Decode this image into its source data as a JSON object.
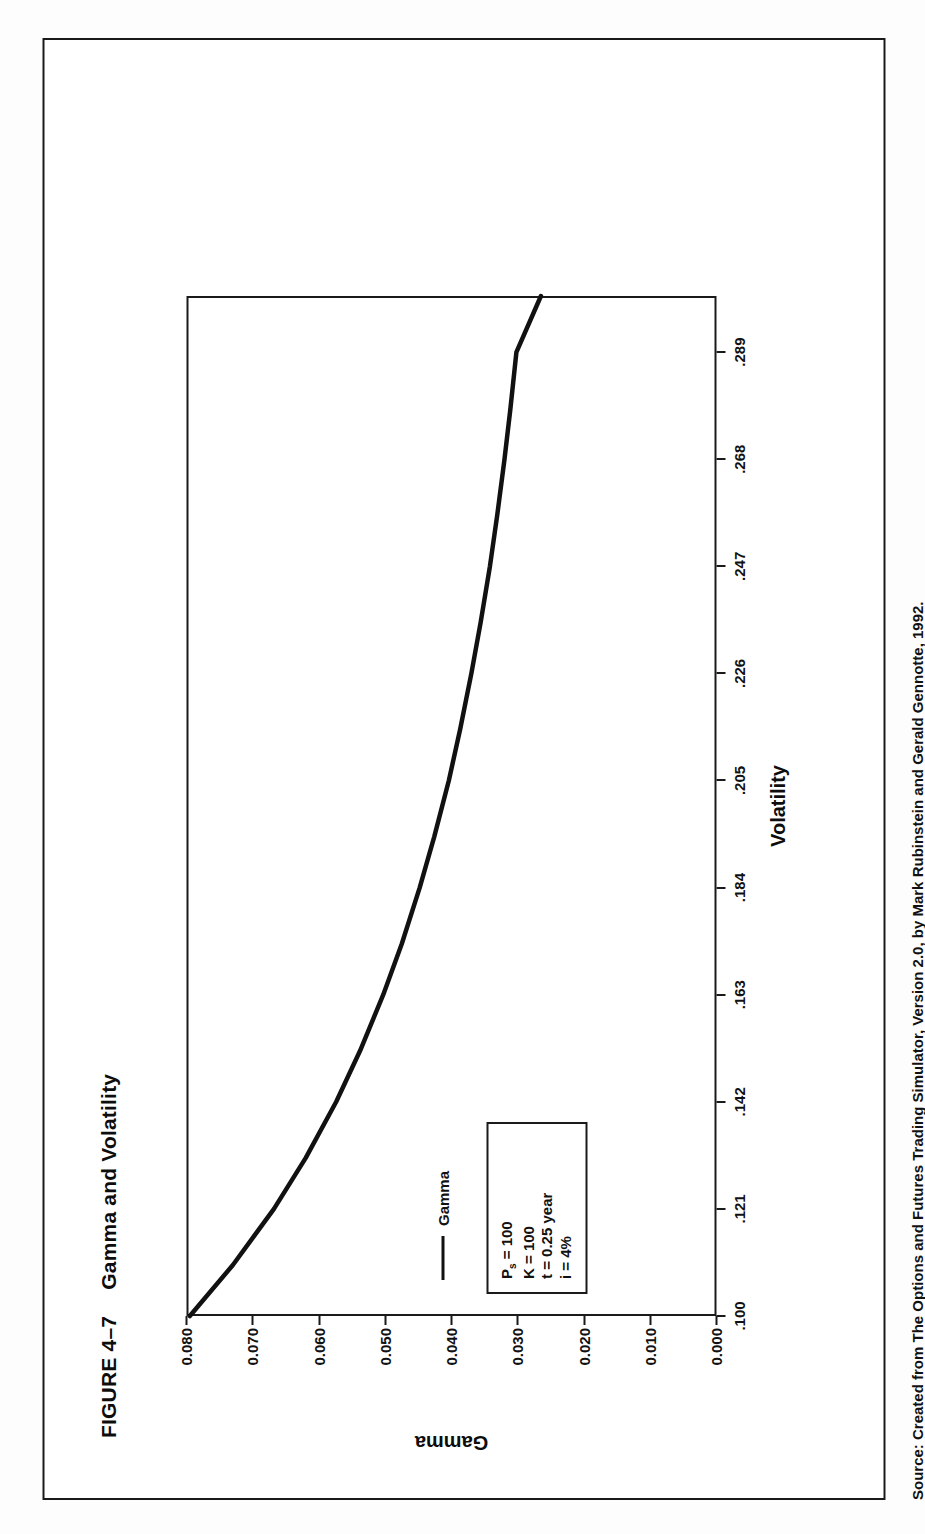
{
  "figure": {
    "number_label": "FIGURE 4–7",
    "title": "Gamma and Volatility",
    "source": "Source: Created from The Options and Futures Trading Simulator, Version 2.0, by Mark Rubinstein and Gerald Gennotte, 1992."
  },
  "legend": {
    "series_label": "Gamma",
    "params": [
      {
        "text": "P",
        "sub": "s",
        "rest": " = 100"
      },
      {
        "text": "K",
        "sub": "",
        "rest": " = 100"
      },
      {
        "text": "t",
        "sub": "",
        "rest": " = 0.25 year"
      },
      {
        "text": "i",
        "sub": "",
        "rest": " = 4%"
      }
    ],
    "param_lines": [
      "Ps = 100",
      "K = 100",
      "t = 0.25 year",
      "i = 4%"
    ]
  },
  "chart_data": {
    "type": "line",
    "title": "Gamma and Volatility",
    "xlabel": "Volatility",
    "ylabel": "Gamma",
    "xlim": [
      0.1,
      0.3
    ],
    "ylim": [
      0.0,
      0.08
    ],
    "grid": false,
    "legend_position": "inside-bottom-left",
    "x_tick_labels": [
      ".100",
      ".121",
      ".142",
      ".163",
      ".184",
      ".205",
      ".226",
      ".247",
      ".268",
      ".289"
    ],
    "x_tick_values": [
      0.1,
      0.121,
      0.142,
      0.163,
      0.184,
      0.205,
      0.226,
      0.247,
      0.268,
      0.289
    ],
    "y_tick_labels": [
      "0.000",
      "0.010",
      "0.020",
      "0.030",
      "0.040",
      "0.050",
      "0.060",
      "0.070",
      "0.080"
    ],
    "y_tick_values": [
      0.0,
      0.01,
      0.02,
      0.03,
      0.04,
      0.05,
      0.06,
      0.07,
      0.08
    ],
    "series": [
      {
        "name": "Gamma",
        "x": [
          0.1,
          0.11,
          0.121,
          0.131,
          0.142,
          0.152,
          0.163,
          0.173,
          0.184,
          0.194,
          0.205,
          0.215,
          0.226,
          0.236,
          0.247,
          0.257,
          0.268,
          0.278,
          0.289,
          0.3
        ],
        "y": [
          0.0795,
          0.073,
          0.0668,
          0.062,
          0.0574,
          0.0538,
          0.0503,
          0.0475,
          0.0448,
          0.0426,
          0.0404,
          0.0387,
          0.037,
          0.0356,
          0.0342,
          0.0331,
          0.032,
          0.0311,
          0.0302,
          0.0265
        ]
      }
    ]
  },
  "axis_titles": {
    "x": "Volatility",
    "y": "Gamma"
  }
}
